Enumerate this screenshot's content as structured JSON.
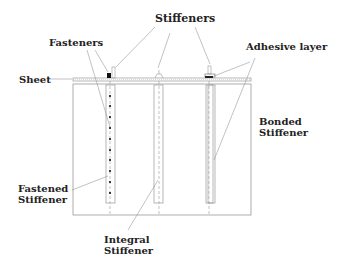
{
  "labels": {
    "stiffeners": "Stiffeners",
    "fasteners": "Fasteners",
    "adhesive_layer": "Adhesive layer",
    "sheet": "Sheet",
    "bonded_line1": "Bonded",
    "bonded_line2": "Stiffener",
    "fastened_line1": "Fastened",
    "fastened_line2": "Stiffener",
    "integral_line1": "Integral",
    "integral_line2": "Stiffener"
  },
  "colors": {
    "line": "#888888",
    "dark": "#222222",
    "fastener": "#111111"
  }
}
